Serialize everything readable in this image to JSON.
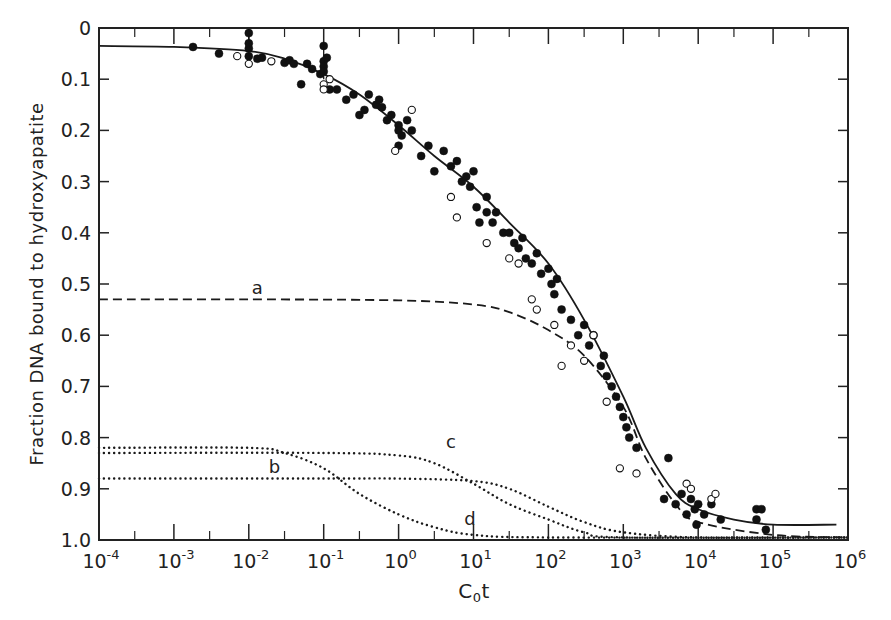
{
  "chart_data": {
    "type": "scatter",
    "title": "",
    "xlabel": "C0t",
    "xlabel_main": "C",
    "xlabel_sub": "0",
    "xlabel_tail": "t",
    "ylabel": "Fraction DNA bound to hydroxyapatite",
    "xscale": "log",
    "xlim": [
      0.0001,
      1000000
    ],
    "ylim": [
      0,
      1.0
    ],
    "y_inverted": true,
    "grid": false,
    "legend": "none (curves labeled inline a, b, c, d)",
    "x_ticks": [
      {
        "base": "10",
        "exp": "-4"
      },
      {
        "base": "10",
        "exp": "-3"
      },
      {
        "base": "10",
        "exp": "-2"
      },
      {
        "base": "10",
        "exp": "-1"
      },
      {
        "base": "10",
        "exp": "0"
      },
      {
        "base": "10",
        "exp": "1"
      },
      {
        "base": "10",
        "exp": "2"
      },
      {
        "base": "10",
        "exp": "3"
      },
      {
        "base": "10",
        "exp": "4"
      },
      {
        "base": "10",
        "exp": "5"
      },
      {
        "base": "10",
        "exp": "6"
      }
    ],
    "y_ticks": [
      "0",
      "0.1",
      "0.2",
      "0.3",
      "0.4",
      "0.5",
      "0.6",
      "0.7",
      "0.8",
      "0.9",
      "1.0"
    ],
    "series": [
      {
        "name": "total fit",
        "style": "solid",
        "points": [
          [
            0.0001,
            0.035
          ],
          [
            0.001,
            0.037
          ],
          [
            0.01,
            0.045
          ],
          [
            0.03,
            0.06
          ],
          [
            0.1,
            0.09
          ],
          [
            0.3,
            0.13
          ],
          [
            1,
            0.19
          ],
          [
            3,
            0.25
          ],
          [
            10,
            0.31
          ],
          [
            30,
            0.38
          ],
          [
            100,
            0.46
          ],
          [
            300,
            0.57
          ],
          [
            1000,
            0.72
          ],
          [
            2000,
            0.82
          ],
          [
            5000,
            0.91
          ],
          [
            10000,
            0.94
          ],
          [
            30000,
            0.96
          ],
          [
            100000,
            0.97
          ],
          [
            700000,
            0.97
          ]
        ]
      },
      {
        "name": "a",
        "label": "a",
        "style": "dashed",
        "points": [
          [
            0.0001,
            0.53
          ],
          [
            0.01,
            0.53
          ],
          [
            1,
            0.532
          ],
          [
            10,
            0.54
          ],
          [
            30,
            0.555
          ],
          [
            100,
            0.59
          ],
          [
            300,
            0.64
          ],
          [
            1000,
            0.74
          ],
          [
            2000,
            0.84
          ],
          [
            5000,
            0.93
          ],
          [
            10000,
            0.965
          ],
          [
            100000,
            0.99
          ],
          [
            1000000,
            0.995
          ]
        ]
      },
      {
        "name": "b",
        "label": "b",
        "style": "dotted",
        "points": [
          [
            0.0001,
            0.88
          ],
          [
            0.1,
            0.88
          ],
          [
            1,
            0.88
          ],
          [
            10,
            0.885
          ],
          [
            30,
            0.9
          ],
          [
            100,
            0.935
          ],
          [
            300,
            0.965
          ],
          [
            1000,
            0.985
          ],
          [
            10000,
            0.995
          ],
          [
            1000000,
            0.995
          ]
        ]
      },
      {
        "name": "c",
        "label": "c",
        "style": "dotted",
        "points": [
          [
            0.0001,
            0.83
          ],
          [
            0.1,
            0.83
          ],
          [
            1,
            0.835
          ],
          [
            3,
            0.85
          ],
          [
            10,
            0.89
          ],
          [
            30,
            0.93
          ],
          [
            100,
            0.96
          ],
          [
            300,
            0.985
          ],
          [
            1000,
            0.995
          ],
          [
            1000000,
            0.995
          ]
        ]
      },
      {
        "name": "d",
        "label": "d",
        "style": "dotted",
        "points": [
          [
            0.0001,
            0.82
          ],
          [
            0.01,
            0.82
          ],
          [
            0.03,
            0.83
          ],
          [
            0.1,
            0.86
          ],
          [
            0.3,
            0.91
          ],
          [
            1,
            0.95
          ],
          [
            3,
            0.975
          ],
          [
            10,
            0.99
          ],
          [
            100,
            0.995
          ],
          [
            1000000,
            0.995
          ]
        ]
      },
      {
        "name": "filled data",
        "marker": "filled-circle",
        "points": [
          [
            0.0018,
            0.037
          ],
          [
            0.004,
            0.05
          ],
          [
            0.01,
            0.01
          ],
          [
            0.01,
            0.04
          ],
          [
            0.01,
            0.055
          ],
          [
            0.01,
            0.03
          ],
          [
            0.013,
            0.06
          ],
          [
            0.015,
            0.058
          ],
          [
            0.03,
            0.068
          ],
          [
            0.035,
            0.063
          ],
          [
            0.04,
            0.07
          ],
          [
            0.05,
            0.11
          ],
          [
            0.06,
            0.07
          ],
          [
            0.07,
            0.08
          ],
          [
            0.09,
            0.09
          ],
          [
            0.1,
            0.035
          ],
          [
            0.1,
            0.065
          ],
          [
            0.1,
            0.075
          ],
          [
            0.1,
            0.085
          ],
          [
            0.11,
            0.058
          ],
          [
            0.12,
            0.12
          ],
          [
            0.15,
            0.12
          ],
          [
            0.2,
            0.14
          ],
          [
            0.25,
            0.13
          ],
          [
            0.3,
            0.17
          ],
          [
            0.35,
            0.16
          ],
          [
            0.4,
            0.13
          ],
          [
            0.5,
            0.15
          ],
          [
            0.55,
            0.14
          ],
          [
            0.6,
            0.155
          ],
          [
            0.7,
            0.18
          ],
          [
            0.8,
            0.17
          ],
          [
            1,
            0.19
          ],
          [
            1,
            0.2
          ],
          [
            1,
            0.23
          ],
          [
            1.1,
            0.21
          ],
          [
            1.3,
            0.18
          ],
          [
            1.5,
            0.2
          ],
          [
            2,
            0.25
          ],
          [
            2.5,
            0.23
          ],
          [
            3,
            0.28
          ],
          [
            4,
            0.24
          ],
          [
            5,
            0.27
          ],
          [
            6,
            0.26
          ],
          [
            7,
            0.3
          ],
          [
            8,
            0.29
          ],
          [
            9,
            0.31
          ],
          [
            10,
            0.28
          ],
          [
            11,
            0.35
          ],
          [
            12,
            0.38
          ],
          [
            15,
            0.33
          ],
          [
            15,
            0.36
          ],
          [
            18,
            0.38
          ],
          [
            20,
            0.36
          ],
          [
            25,
            0.4
          ],
          [
            30,
            0.4
          ],
          [
            35,
            0.42
          ],
          [
            40,
            0.43
          ],
          [
            45,
            0.41
          ],
          [
            50,
            0.45
          ],
          [
            60,
            0.46
          ],
          [
            70,
            0.44
          ],
          [
            80,
            0.48
          ],
          [
            100,
            0.47
          ],
          [
            110,
            0.5
          ],
          [
            120,
            0.52
          ],
          [
            130,
            0.49
          ],
          [
            150,
            0.55
          ],
          [
            200,
            0.57
          ],
          [
            250,
            0.6
          ],
          [
            300,
            0.58
          ],
          [
            350,
            0.62
          ],
          [
            400,
            0.6
          ],
          [
            500,
            0.66
          ],
          [
            550,
            0.64
          ],
          [
            600,
            0.68
          ],
          [
            700,
            0.7
          ],
          [
            800,
            0.72
          ],
          [
            900,
            0.74
          ],
          [
            1000,
            0.76
          ],
          [
            1100,
            0.78
          ],
          [
            1200,
            0.8
          ],
          [
            1500,
            0.82
          ],
          [
            4000,
            0.84
          ],
          [
            3500,
            0.92
          ],
          [
            5000,
            0.93
          ],
          [
            6000,
            0.91
          ],
          [
            7000,
            0.95
          ],
          [
            8000,
            0.92
          ],
          [
            9000,
            0.94
          ],
          [
            9500,
            0.97
          ],
          [
            10000,
            0.93
          ],
          [
            12000,
            0.95
          ],
          [
            15000,
            0.93
          ],
          [
            20000,
            0.96
          ],
          [
            60000,
            0.94
          ],
          [
            70000,
            0.94
          ],
          [
            60000,
            0.96
          ],
          [
            80000,
            0.98
          ]
        ]
      },
      {
        "name": "open data",
        "marker": "open-circle",
        "points": [
          [
            0.007,
            0.055
          ],
          [
            0.01,
            0.07
          ],
          [
            0.02,
            0.065
          ],
          [
            0.1,
            0.11
          ],
          [
            0.1,
            0.12
          ],
          [
            0.12,
            0.1
          ],
          [
            0.9,
            0.24
          ],
          [
            1.5,
            0.16
          ],
          [
            5,
            0.33
          ],
          [
            6,
            0.37
          ],
          [
            15,
            0.42
          ],
          [
            30,
            0.45
          ],
          [
            40,
            0.46
          ],
          [
            60,
            0.53
          ],
          [
            70,
            0.55
          ],
          [
            120,
            0.58
          ],
          [
            150,
            0.66
          ],
          [
            200,
            0.62
          ],
          [
            300,
            0.65
          ],
          [
            400,
            0.6
          ],
          [
            600,
            0.73
          ],
          [
            900,
            0.86
          ],
          [
            1500,
            0.87
          ],
          [
            7000,
            0.89
          ],
          [
            8000,
            0.9
          ],
          [
            15000,
            0.92
          ],
          [
            17000,
            0.91
          ]
        ]
      }
    ],
    "annotations": [
      {
        "text": "a",
        "x": 0.013,
        "y": 0.52
      },
      {
        "text": "b",
        "x": 0.022,
        "y": 0.87
      },
      {
        "text": "c",
        "x": 5,
        "y": 0.82
      },
      {
        "text": "d",
        "x": 9,
        "y": 0.97
      }
    ],
    "plot_px": {
      "left": 99,
      "right": 848,
      "top": 28,
      "bottom": 540
    }
  }
}
